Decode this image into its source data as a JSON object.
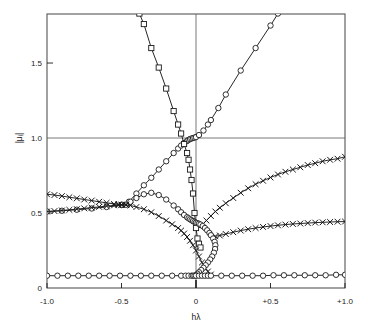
{
  "figure": {
    "background": "#ffffff",
    "ink": "#1a1a1a",
    "frame_color": "#555555"
  },
  "axes": {
    "x_title": "hλ",
    "y_title": "|μᵢ|",
    "x_ticks": [
      "-1.0",
      "-0.5",
      "0",
      "+0.5",
      "+1.0"
    ],
    "x_tick_values": [
      -1.0,
      -0.5,
      0,
      0.5,
      1.0
    ],
    "y_ticks": [
      "0",
      "0.5",
      "1.0",
      "1.5"
    ],
    "y_tick_values": [
      0,
      0.5,
      1.0,
      1.5
    ],
    "x_range": [
      -1.0,
      1.0
    ],
    "y_range": [
      0,
      1.827
    ],
    "gridlines": [
      "y=1.0",
      "x=0"
    ],
    "grid": "minimal"
  },
  "chart_data": {
    "type": "line",
    "title": "",
    "xlabel": "hλ",
    "ylabel": "|μᵢ|",
    "xlim": [
      -1.0,
      1.0
    ],
    "ylim": [
      0.0,
      1.827
    ],
    "grid": false,
    "legend": "none",
    "markers": [
      "circle",
      "square",
      "cross"
    ],
    "series": [
      {
        "name": "branch-1-circle-upper",
        "marker": "circle",
        "x": [
          -1.0,
          -0.9,
          -0.8,
          -0.7,
          -0.6,
          -0.5,
          -0.45,
          -0.4,
          -0.35,
          -0.3,
          -0.25,
          -0.2,
          -0.15,
          -0.12,
          -0.1,
          -0.08,
          -0.06,
          -0.05,
          -0.04,
          -0.03,
          -0.02,
          -0.01,
          0.0,
          0.02,
          0.05,
          0.08,
          0.1,
          0.15,
          0.2,
          0.3,
          0.4,
          0.5,
          0.55
        ],
        "y": [
          0.51,
          0.515,
          0.522,
          0.53,
          0.54,
          0.553,
          0.575,
          0.63,
          0.685,
          0.735,
          0.79,
          0.845,
          0.9,
          0.93,
          0.95,
          0.967,
          0.98,
          0.988,
          0.993,
          0.997,
          1.0,
          1.003,
          1.006,
          1.02,
          1.05,
          1.09,
          1.12,
          1.2,
          1.29,
          1.45,
          1.6,
          1.75,
          1.83
        ]
      },
      {
        "name": "branch-2-square-descending",
        "marker": "square",
        "x": [
          -0.38,
          -0.35,
          -0.3,
          -0.25,
          -0.2,
          -0.15,
          -0.12,
          -0.1,
          -0.08,
          -0.06,
          -0.05,
          -0.04,
          -0.03,
          -0.02,
          -0.01,
          0.0,
          0.01,
          0.02,
          0.03
        ],
        "y": [
          1.83,
          1.76,
          1.6,
          1.47,
          1.33,
          1.18,
          1.09,
          1.03,
          0.96,
          0.9,
          0.855,
          0.79,
          0.72,
          0.63,
          0.5,
          0.4,
          0.33,
          0.295,
          0.27
        ]
      },
      {
        "name": "branch-3-circle-arch",
        "marker": "circle",
        "x": [
          -0.47,
          -0.44,
          -0.4,
          -0.35,
          -0.3,
          -0.25,
          -0.2,
          -0.15,
          -0.12,
          -0.1,
          -0.08,
          -0.06,
          -0.05,
          -0.04,
          -0.03,
          -0.02,
          -0.01,
          0.0
        ],
        "y": [
          0.555,
          0.575,
          0.6,
          0.625,
          0.635,
          0.62,
          0.59,
          0.55,
          0.525,
          0.505,
          0.487,
          0.472,
          0.465,
          0.458,
          0.452,
          0.446,
          0.44,
          0.435
        ]
      },
      {
        "name": "branch-4-cross-left-upper",
        "marker": "cross",
        "x": [
          -1.0,
          -0.95,
          -0.9,
          -0.85,
          -0.8,
          -0.75,
          -0.7,
          -0.65,
          -0.6,
          -0.55,
          -0.52,
          -0.5,
          -0.47
        ],
        "y": [
          0.625,
          0.62,
          0.613,
          0.605,
          0.598,
          0.59,
          0.583,
          0.575,
          0.568,
          0.56,
          0.558,
          0.556,
          0.555
        ]
      },
      {
        "name": "branch-5-cross-left-lower",
        "marker": "cross",
        "x": [
          -1.0,
          -0.95,
          -0.9,
          -0.85,
          -0.8,
          -0.75,
          -0.7,
          -0.65,
          -0.6,
          -0.55,
          -0.52,
          -0.5,
          -0.47
        ],
        "y": [
          0.51,
          0.513,
          0.517,
          0.521,
          0.526,
          0.531,
          0.536,
          0.541,
          0.546,
          0.551,
          0.553,
          0.554,
          0.555
        ]
      },
      {
        "name": "branch-6-cross-descending",
        "marker": "cross",
        "x": [
          -0.47,
          -0.44,
          -0.4,
          -0.35,
          -0.3,
          -0.25,
          -0.2,
          -0.16,
          -0.12,
          -0.1,
          -0.08,
          -0.06,
          -0.04,
          -0.02,
          0.0,
          0.02,
          0.04,
          0.06,
          0.08,
          0.1
        ],
        "y": [
          0.555,
          0.55,
          0.54,
          0.525,
          0.505,
          0.48,
          0.45,
          0.425,
          0.4,
          0.383,
          0.363,
          0.34,
          0.315,
          0.285,
          0.25,
          0.21,
          0.17,
          0.135,
          0.11,
          0.09
        ]
      },
      {
        "name": "branch-7-cross-right-upper",
        "marker": "cross",
        "x": [
          0.04,
          0.07,
          0.1,
          0.13,
          0.16,
          0.2,
          0.25,
          0.3,
          0.35,
          0.4,
          0.45,
          0.5,
          0.55,
          0.6,
          0.65,
          0.7,
          0.75,
          0.8,
          0.85,
          0.9,
          0.95,
          1.0
        ],
        "y": [
          0.42,
          0.45,
          0.48,
          0.51,
          0.535,
          0.565,
          0.6,
          0.635,
          0.665,
          0.692,
          0.715,
          0.737,
          0.757,
          0.775,
          0.79,
          0.805,
          0.82,
          0.832,
          0.845,
          0.855,
          0.862,
          0.875
        ]
      },
      {
        "name": "branch-8-cross-right-lower",
        "marker": "cross",
        "x": [
          0.13,
          0.16,
          0.2,
          0.25,
          0.3,
          0.35,
          0.4,
          0.45,
          0.5,
          0.55,
          0.6,
          0.65,
          0.7,
          0.75,
          0.8,
          0.85,
          0.9,
          0.95,
          1.0
        ],
        "y": [
          0.345,
          0.35,
          0.36,
          0.372,
          0.383,
          0.392,
          0.4,
          0.407,
          0.413,
          0.418,
          0.423,
          0.427,
          0.43,
          0.433,
          0.436,
          0.438,
          0.44,
          0.442,
          0.443
        ]
      },
      {
        "name": "branch-9-circle-loop",
        "marker": "circle",
        "x": [
          0.0,
          0.01,
          0.02,
          0.03,
          0.045,
          0.06,
          0.075,
          0.09,
          0.1,
          0.115,
          0.125,
          0.13,
          0.128,
          0.12,
          0.108,
          0.095,
          0.08,
          0.065,
          0.05,
          0.035,
          0.02,
          0.01,
          0.0
        ],
        "y": [
          0.435,
          0.432,
          0.428,
          0.423,
          0.413,
          0.4,
          0.385,
          0.367,
          0.352,
          0.33,
          0.308,
          0.285,
          0.26,
          0.235,
          0.21,
          0.19,
          0.17,
          0.152,
          0.135,
          0.12,
          0.105,
          0.095,
          0.085
        ]
      },
      {
        "name": "branch-10-circle-baseline",
        "marker": "circle",
        "x": [
          -1.0,
          -0.93,
          -0.86,
          -0.79,
          -0.72,
          -0.65,
          -0.58,
          -0.51,
          -0.44,
          -0.37,
          -0.3,
          -0.23,
          -0.16,
          -0.1,
          -0.07,
          -0.05,
          -0.03,
          -0.02,
          -0.01,
          0.0,
          0.02,
          0.04,
          0.06,
          0.08,
          0.1,
          0.17,
          0.24,
          0.31,
          0.38,
          0.45,
          0.52,
          0.59,
          0.66,
          0.73,
          0.8,
          0.87,
          0.94,
          1.0
        ],
        "y": [
          0.082,
          0.082,
          0.082,
          0.082,
          0.082,
          0.082,
          0.082,
          0.082,
          0.082,
          0.082,
          0.082,
          0.082,
          0.082,
          0.082,
          0.082,
          0.082,
          0.082,
          0.082,
          0.082,
          0.082,
          0.082,
          0.082,
          0.082,
          0.082,
          0.082,
          0.082,
          0.082,
          0.082,
          0.082,
          0.082,
          0.085,
          0.085,
          0.085,
          0.085,
          0.085,
          0.085,
          0.088,
          0.088
        ]
      }
    ]
  }
}
